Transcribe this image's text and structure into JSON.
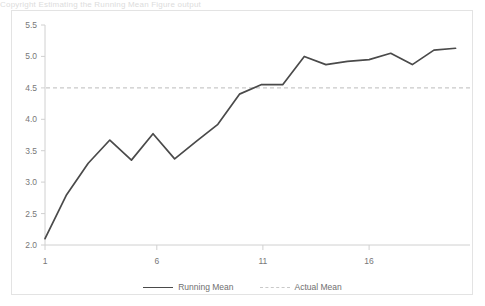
{
  "page": {
    "top_cut_text": "Copyright   Estimating   the   Running   Mean                Figure   output"
  },
  "chart_data": {
    "type": "line",
    "title": "",
    "subtitle": "",
    "xlabel": "",
    "ylabel": "",
    "x": [
      1,
      2,
      3,
      4,
      5,
      6,
      7,
      8,
      9,
      10,
      11,
      12,
      13,
      14,
      15,
      16,
      17,
      18,
      19,
      20
    ],
    "series": [
      {
        "name": "Running Mean",
        "style": "solid",
        "color": "#4a4a4a",
        "values": [
          2.1,
          2.8,
          3.3,
          3.67,
          3.35,
          3.77,
          3.37,
          3.65,
          3.92,
          4.4,
          4.55,
          4.55,
          5.0,
          4.87,
          4.92,
          4.95,
          5.05,
          4.87,
          5.1,
          5.13
        ]
      },
      {
        "name": "Actual Mean",
        "style": "dashed",
        "color": "#c9c9c9",
        "constant": 4.5
      }
    ],
    "ylim": [
      2.0,
      5.5
    ],
    "xlim": [
      1,
      20
    ],
    "yticks": [
      "2.0",
      "2.5",
      "3.0",
      "3.5",
      "4.0",
      "4.5",
      "5.0",
      "5.5"
    ],
    "ytick_values": [
      2.0,
      2.5,
      3.0,
      3.5,
      4.0,
      4.5,
      5.0,
      5.5
    ],
    "xticks": [
      "1",
      "6",
      "11",
      "16"
    ],
    "xtick_values": [
      1,
      6,
      11,
      16
    ],
    "grid": false,
    "legend_position": "bottom",
    "legend": [
      "Running Mean",
      "Actual Mean"
    ],
    "plot_bg": "#ffffff",
    "frame_color": "#e3e3e3",
    "axis_color": "#d0d0d0"
  }
}
